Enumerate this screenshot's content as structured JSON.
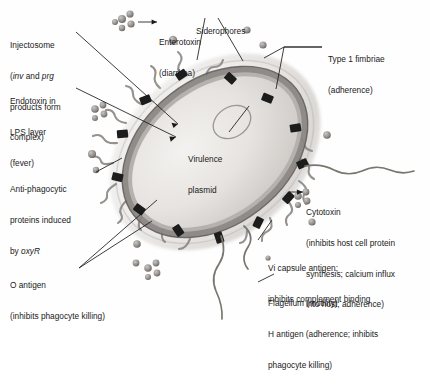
{
  "figure": {
    "organism_structure": "gram-negative bacillus",
    "background_color": "#fefefe",
    "ink_color": "#1a1a1a",
    "capsule_color": "#d8d5d2",
    "membrane_color": "#6e6a67",
    "cytoplasm_color": "#e9e7e4",
    "injectosome_color": "#1c1c1c",
    "appendage_color": "#8b8784",
    "granule_color": "#9a9693"
  },
  "labels": {
    "injectosome": {
      "line1": "Injectosome",
      "line2_pre": "(",
      "line2_em1": "inv",
      "line2_mid": " and ",
      "line2_em2": "prg",
      "line3": "products form",
      "line4": "complex)"
    },
    "endotoxin": {
      "line1": "Endotoxin in",
      "line2": "LPS layer",
      "line3": "(fever)"
    },
    "antiphagocytic": {
      "line1": "Anti-phagocytic",
      "line2": "proteins induced",
      "line3_pre": "by ",
      "line3_em": "oxyR"
    },
    "o_antigen": {
      "line1": "O antigen",
      "line2": "(inhibits phagocyte killing)"
    },
    "enterotoxin": {
      "line1": "Enterotoxin",
      "line2": "(diarrhea)"
    },
    "siderophores": {
      "line1": "Siderophores"
    },
    "type1_fimbriae": {
      "line1": "Type 1 fimbriae",
      "line2": "(adherence)"
    },
    "virulence_plasmid": {
      "line1": "Virulence",
      "line2": "plasmid"
    },
    "cytotoxin": {
      "line1": "Cytotoxin",
      "line2": "(inhibits host cell protein",
      "line3": "synthesis; calcium influx",
      "line4": "into host; adherence)"
    },
    "vi_capsule": {
      "line1": "Vi capsule antigen;",
      "line2": "inhibits complement binding"
    },
    "flagellum": {
      "line1": "Flagellum (motility)",
      "line2": "H antigen (adherence; inhibits",
      "line3": "phagocyte killing)"
    }
  }
}
